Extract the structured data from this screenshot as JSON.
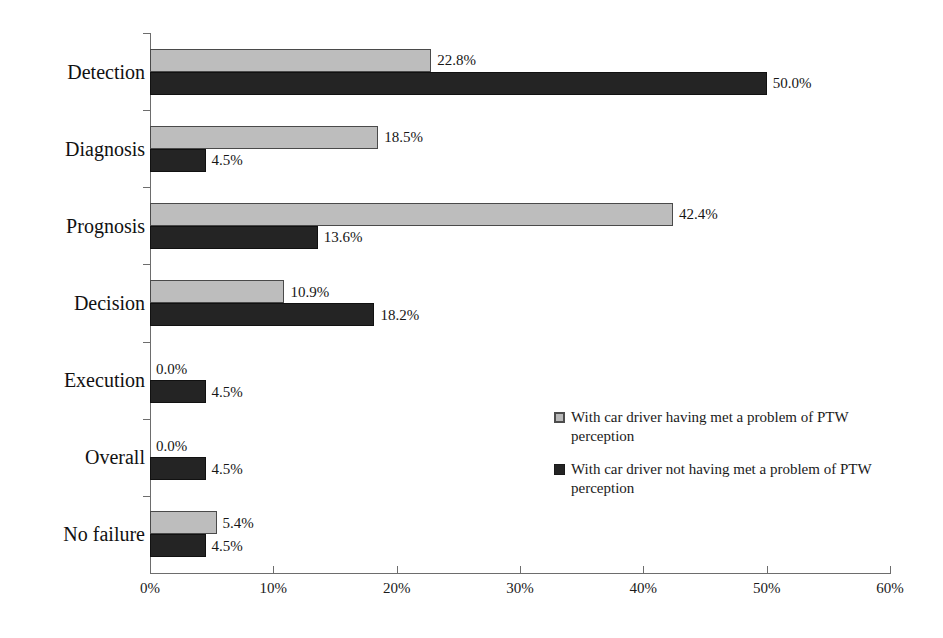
{
  "chart_data": {
    "type": "bar",
    "orientation": "horizontal",
    "title": "",
    "xlabel": "",
    "ylabel": "",
    "xlim": [
      0,
      60
    ],
    "xunit": "%",
    "grid": false,
    "legend_position": "middle-right",
    "categories": [
      "Detection",
      "Diagnosis",
      "Prognosis",
      "Decision",
      "Execution",
      "Overall",
      "No failure"
    ],
    "xticks": [
      "0%",
      "10%",
      "20%",
      "30%",
      "40%",
      "50%",
      "60%"
    ],
    "xtick_values": [
      0,
      10,
      20,
      30,
      40,
      50,
      60
    ],
    "series": [
      {
        "name": "With car driver having met a problem of PTW perception",
        "color": "#bdbdbd",
        "values": [
          22.8,
          18.5,
          42.4,
          10.9,
          0.0,
          0.0,
          5.4
        ],
        "labels": [
          "22.8%",
          "18.5%",
          "42.4%",
          "10.9%",
          "0.0%",
          "0.0%",
          "5.4%"
        ]
      },
      {
        "name": "With car driver not having met a problem of PTW perception",
        "color": "#242424",
        "values": [
          50.0,
          4.5,
          13.6,
          18.2,
          4.5,
          4.5,
          4.5
        ],
        "labels": [
          "50.0%",
          "4.5%",
          "13.6%",
          "18.2%",
          "4.5%",
          "4.5%",
          "4.5%"
        ]
      }
    ]
  },
  "legend": {
    "entries": [
      {
        "swatch": "series-a",
        "text": "With car driver having met a problem of PTW perception"
      },
      {
        "swatch": "series-b",
        "text": "With car driver not having met a problem of PTW perception"
      }
    ]
  },
  "colors": {
    "series_a": "#bdbdbd",
    "series_b": "#242424",
    "axis": "#6d6d6d",
    "background": "#ffffff",
    "text": "#111111"
  }
}
